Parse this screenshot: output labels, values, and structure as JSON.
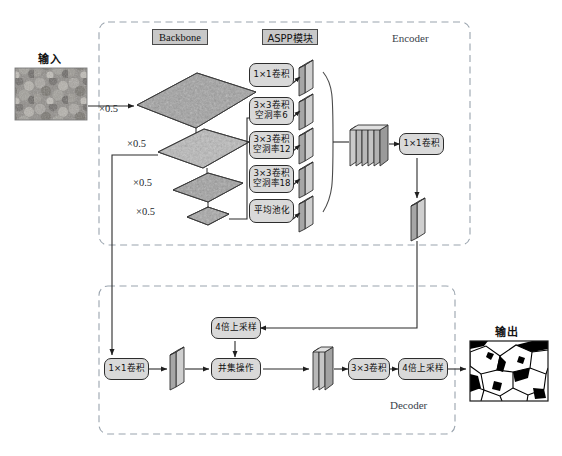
{
  "figure": {
    "kind": "network-architecture-diagram"
  },
  "palette": {
    "chip_fill": "#c8c8c8",
    "chip_stroke": "#4a4a4a",
    "opbox_fill": "#d9d9d9",
    "opbox_stroke": "#2d2d2d",
    "arrow": "#2b2b2b",
    "dashed_group": "#8d99a6",
    "slab_face": "#b3b3b3",
    "slab_side": "#6e6e6e",
    "plane_dark": "#8e8e8e",
    "plane_light": "#bfbfbf"
  },
  "io": {
    "input_label": "输入",
    "output_label": "输出"
  },
  "groups": {
    "encoder_label": "Encoder",
    "decoder_label": "Decoder"
  },
  "headers": {
    "backbone": "Backbone",
    "aspp": "ASPP模块"
  },
  "backbone": {
    "scale_labels": [
      "×0.5",
      "×0.5",
      "×0.5",
      "×0.5"
    ],
    "stages": 4
  },
  "aspp": {
    "branches": [
      {
        "line1": "1×1卷积",
        "line2": ""
      },
      {
        "line1": "3×3卷积",
        "line2": "空洞率6"
      },
      {
        "line1": "3×3卷积",
        "line2": "空洞率12"
      },
      {
        "line1": "3×3卷积",
        "line2": "空洞率18"
      },
      {
        "line1": "平均池化",
        "line2": ""
      }
    ],
    "concat_slabs": 5
  },
  "encoder_ops": {
    "conv1x1_after_concat": "1×1卷积"
  },
  "decoder_ops": {
    "conv1x1_skip": "1×1卷积",
    "upsample_4x_top": "4倍上采样",
    "concat_op": "并集操作",
    "conv3x3": "3×3卷积",
    "upsample_4x_final": "4倍上采样"
  }
}
